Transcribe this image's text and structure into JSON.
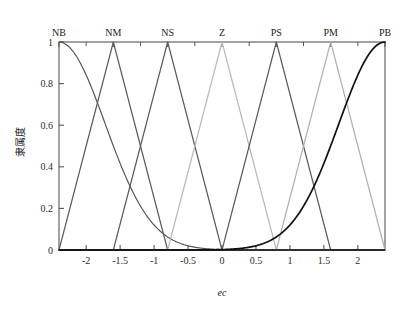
{
  "chart_data": {
    "type": "line",
    "title": "",
    "xlabel": "ec",
    "ylabel": "隶属度",
    "xlim": [
      -2.4,
      2.4
    ],
    "ylim": [
      0,
      1.0
    ],
    "grid": false,
    "legend_position": "top-axis",
    "x_ticks": [
      -2,
      -1.5,
      -1,
      -0.5,
      0,
      0.5,
      1,
      1.5,
      2
    ],
    "x_tick_labels": [
      "-2",
      "-1.5",
      "-1",
      "-0.5",
      "0",
      "0.5",
      "1",
      "1.5",
      "2"
    ],
    "y_ticks": [
      0,
      0.2,
      0.4,
      0.6,
      0.8,
      1
    ],
    "y_tick_labels": [
      "0",
      "0.2",
      "0.4",
      "0.6",
      "0.8",
      "1"
    ],
    "top_axis_labels": [
      "NB",
      "NM",
      "NS",
      "Z",
      "PS",
      "PM",
      "PB"
    ],
    "top_axis_positions": [
      -2.4,
      -1.6,
      -0.8,
      0,
      0.8,
      1.6,
      2.4
    ],
    "series": [
      {
        "name": "NB",
        "shape": "gaussian-shoulder-left",
        "color": "#555555",
        "peak": -2.4,
        "sigma": 0.68,
        "points": [
          [
            -2.4,
            1.0
          ],
          [
            -2.2,
            0.985
          ],
          [
            -2.0,
            0.94
          ],
          [
            -1.8,
            0.86
          ],
          [
            -1.6,
            0.75
          ],
          [
            -1.4,
            0.63
          ],
          [
            -1.2,
            0.5
          ],
          [
            -1.0,
            0.38
          ],
          [
            -0.8,
            0.27
          ],
          [
            -0.6,
            0.18
          ],
          [
            -0.4,
            0.115
          ],
          [
            -0.2,
            0.068
          ],
          [
            0.0,
            0.038
          ],
          [
            0.2,
            0.02
          ],
          [
            0.4,
            0.0095
          ],
          [
            0.6,
            0.004
          ],
          [
            0.8,
            0.0016
          ],
          [
            1.2,
            0.0
          ],
          [
            2.4,
            0.0
          ]
        ]
      },
      {
        "name": "NM",
        "shape": "triangle",
        "color": "#5a5a5a",
        "left": -2.4,
        "peak": -1.6,
        "right": -0.8,
        "points": [
          [
            -2.4,
            0.0
          ],
          [
            -1.6,
            1.0
          ],
          [
            -0.8,
            0.0
          ],
          [
            2.4,
            0.0
          ]
        ]
      },
      {
        "name": "NS",
        "shape": "triangle",
        "color": "#5a5a5a",
        "left": -1.6,
        "peak": -0.8,
        "right": 0.0,
        "points": [
          [
            -2.4,
            0.0
          ],
          [
            -1.6,
            0.0
          ],
          [
            -0.8,
            1.0
          ],
          [
            0.0,
            0.0
          ],
          [
            2.4,
            0.0
          ]
        ]
      },
      {
        "name": "Z",
        "shape": "triangle",
        "color": "#b9b9b9",
        "left": -0.8,
        "peak": 0.0,
        "right": 0.8,
        "points": [
          [
            -2.4,
            0.0
          ],
          [
            -0.8,
            0.0
          ],
          [
            0.0,
            1.0
          ],
          [
            0.8,
            0.0
          ],
          [
            2.4,
            0.0
          ]
        ]
      },
      {
        "name": "PS",
        "shape": "triangle",
        "color": "#5a5a5a",
        "left": 0.0,
        "peak": 0.8,
        "right": 1.6,
        "points": [
          [
            -2.4,
            0.0
          ],
          [
            0.0,
            0.0
          ],
          [
            0.8,
            1.0
          ],
          [
            1.6,
            0.0
          ],
          [
            2.4,
            0.0
          ]
        ]
      },
      {
        "name": "PM",
        "shape": "triangle",
        "color": "#b0b0b0",
        "left": 0.8,
        "peak": 1.6,
        "right": 2.4,
        "points": [
          [
            -2.4,
            0.0
          ],
          [
            0.8,
            0.0
          ],
          [
            1.6,
            1.0
          ],
          [
            2.4,
            0.0
          ]
        ]
      },
      {
        "name": "PB",
        "shape": "gaussian-shoulder-right",
        "color": "#111111",
        "peak": 2.4,
        "sigma": 0.68,
        "points": [
          [
            -2.4,
            0.0
          ],
          [
            -1.2,
            0.0
          ],
          [
            -0.8,
            0.0016
          ],
          [
            -0.6,
            0.004
          ],
          [
            -0.4,
            0.0095
          ],
          [
            -0.2,
            0.02
          ],
          [
            0.0,
            0.038
          ],
          [
            0.2,
            0.068
          ],
          [
            0.4,
            0.115
          ],
          [
            0.6,
            0.18
          ],
          [
            0.8,
            0.27
          ],
          [
            1.0,
            0.38
          ],
          [
            1.2,
            0.5
          ],
          [
            1.4,
            0.63
          ],
          [
            1.6,
            0.75
          ],
          [
            1.8,
            0.86
          ],
          [
            2.0,
            0.94
          ],
          [
            2.2,
            0.985
          ],
          [
            2.4,
            1.0
          ]
        ]
      }
    ],
    "baseline": {
      "value": 0,
      "color": "#111111"
    }
  },
  "figure": {
    "background_color": "#ffffff",
    "axis_color": "#555555"
  }
}
